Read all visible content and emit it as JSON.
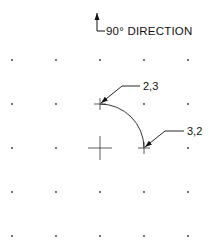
{
  "direction_label": "90°  DIRECTION",
  "grid": {
    "columns": 5,
    "rows": 5
  },
  "center_point": {
    "col": 2,
    "row": 2
  },
  "arc": {
    "start_point": "2,3",
    "end_point": "3,2",
    "direction": "clockwise"
  },
  "callouts": [
    {
      "label": "2,3",
      "col": 2,
      "row": 1
    },
    {
      "label": "3,2",
      "col": 3,
      "row": 2
    }
  ],
  "colors": {
    "ink": "#111111",
    "background": "#ffffff"
  }
}
